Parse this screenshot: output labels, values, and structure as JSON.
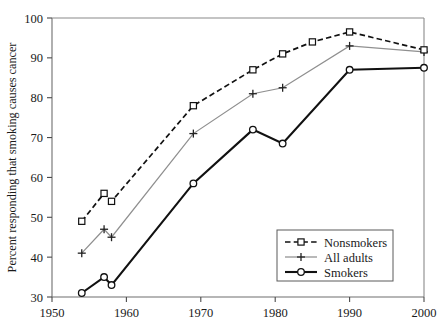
{
  "chart_data": {
    "type": "line",
    "title": "",
    "subtitle": "",
    "xlabel": "",
    "ylabel": "Percent responding that smoking causes cancer",
    "xlim": [
      1950,
      2000
    ],
    "ylim": [
      30,
      100
    ],
    "xticks": [
      1950,
      1960,
      1970,
      1980,
      1990,
      2000
    ],
    "xtick_labels": [
      "1950",
      "1960",
      "1970",
      "1980",
      "1990",
      "2000"
    ],
    "yticks": [
      30,
      40,
      50,
      60,
      70,
      80,
      90,
      100
    ],
    "ytick_labels": [
      "30",
      "40",
      "50",
      "60",
      "70",
      "80",
      "90",
      "100"
    ],
    "grid": false,
    "legend_position": "bottom-right",
    "series": [
      {
        "name": "Nonsmokers",
        "marker": "square",
        "line_style": "dashed",
        "color": "#111111",
        "x": [
          1954,
          1957,
          1958,
          1969,
          1977,
          1981,
          1985,
          1990,
          2000
        ],
        "values": [
          49,
          56,
          54,
          78,
          87,
          91,
          94,
          96.5,
          92
        ]
      },
      {
        "name": "All adults",
        "marker": "plus",
        "line_style": "solid-thin",
        "color": "#8f8f8f",
        "x": [
          1954,
          1957,
          1958,
          1969,
          1977,
          1981,
          1990,
          2000
        ],
        "values": [
          41,
          47,
          45,
          71,
          81,
          82.5,
          93,
          91.5
        ]
      },
      {
        "name": "Smokers",
        "marker": "circle",
        "line_style": "solid-thick",
        "color": "#111111",
        "x": [
          1954,
          1957,
          1958,
          1969,
          1977,
          1981,
          1990,
          2000
        ],
        "values": [
          31,
          35,
          33,
          58.5,
          72,
          68.5,
          87,
          87.5
        ]
      }
    ]
  },
  "legend": {
    "entries": [
      {
        "label": "Nonsmokers"
      },
      {
        "label": "All adults"
      },
      {
        "label": "Smokers"
      }
    ]
  }
}
